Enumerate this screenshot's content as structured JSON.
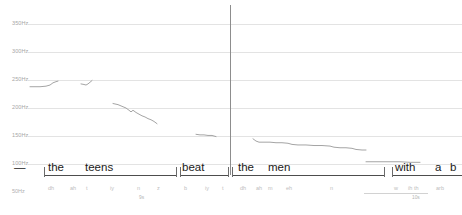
{
  "view": {
    "kind": "pitch-contour-annotation",
    "cursor_x_px": 230,
    "background": "#ffffff",
    "grid_color": "#e3e3e3",
    "contour_color": "#9a9a9a",
    "cursor_color": "#8d8d8d",
    "word_tier_color": "#1a1a1a",
    "phone_tier_color": "#bdbdbd"
  },
  "axis_y": {
    "unit": "Hz",
    "bottom_label": "50Hz",
    "ticks": [
      {
        "label": "350Hz",
        "value": 350,
        "y_px": 24
      },
      {
        "label": "300Hz",
        "value": 300,
        "y_px": 52
      },
      {
        "label": "250Hz",
        "value": 250,
        "y_px": 80
      },
      {
        "label": "200Hz",
        "value": 200,
        "y_px": 108
      },
      {
        "label": "150Hz",
        "value": 150,
        "y_px": 136
      },
      {
        "label": "100Hz",
        "value": 100,
        "y_px": 164
      }
    ]
  },
  "axis_x": {
    "unit": "s",
    "ticks": [
      {
        "label": "9s",
        "value": 9,
        "x_px": 139
      },
      {
        "label": "10s",
        "value": 10,
        "x_px": 412
      }
    ]
  },
  "chart_data": {
    "type": "line",
    "title": "",
    "xlabel": "",
    "ylabel": "Hz",
    "ylim": [
      50,
      350
    ],
    "grid": true,
    "legend": "none",
    "series": [
      {
        "name": "f0-the",
        "points": [
          [
            30,
            238
          ],
          [
            34,
            238
          ],
          [
            40,
            238
          ],
          [
            46,
            239
          ],
          [
            50,
            241
          ],
          [
            53,
            245
          ],
          [
            56,
            247
          ],
          [
            58,
            248
          ]
        ]
      },
      {
        "name": "f0-teens-onset",
        "points": [
          [
            81,
            243
          ],
          [
            84,
            242
          ],
          [
            86,
            241
          ],
          [
            88,
            243
          ],
          [
            90,
            246
          ],
          [
            92,
            249
          ]
        ]
      },
      {
        "name": "f0-teens",
        "points": [
          [
            113,
            208
          ],
          [
            118,
            206
          ],
          [
            122,
            203
          ],
          [
            126,
            200
          ],
          [
            129,
            196
          ],
          [
            131,
            193
          ],
          [
            133,
            196
          ],
          [
            136,
            192
          ],
          [
            139,
            189
          ],
          [
            142,
            186
          ],
          [
            145,
            184
          ],
          [
            148,
            181
          ],
          [
            151,
            179
          ],
          [
            154,
            176
          ],
          [
            157,
            172
          ]
        ]
      },
      {
        "name": "f0-beat",
        "points": [
          [
            196,
            153
          ],
          [
            200,
            152
          ],
          [
            204,
            152
          ],
          [
            208,
            151
          ],
          [
            212,
            151
          ],
          [
            216,
            149
          ]
        ]
      },
      {
        "name": "f0-the-men",
        "points": [
          [
            253,
            145
          ],
          [
            256,
            141
          ],
          [
            259,
            139
          ],
          [
            264,
            139
          ],
          [
            270,
            139
          ],
          [
            276,
            138
          ],
          [
            282,
            138
          ],
          [
            288,
            137
          ],
          [
            292,
            135
          ],
          [
            298,
            134
          ],
          [
            306,
            134
          ],
          [
            314,
            133
          ],
          [
            322,
            133
          ],
          [
            330,
            132
          ],
          [
            334,
            130
          ],
          [
            340,
            129
          ],
          [
            346,
            129
          ],
          [
            352,
            128
          ],
          [
            356,
            126
          ],
          [
            362,
            125
          ],
          [
            366,
            125
          ]
        ]
      },
      {
        "name": "f0-with",
        "points": [
          [
            366,
            104
          ],
          [
            380,
            104
          ],
          [
            392,
            104
          ],
          [
            400,
            104
          ],
          [
            410,
            103
          ],
          [
            420,
            103
          ]
        ]
      }
    ]
  },
  "tiers": {
    "words": [
      {
        "label": "—",
        "x_px": 14,
        "width_px": 12
      },
      {
        "label": "the",
        "x_px": 48,
        "width_px": 22
      },
      {
        "label": "teens",
        "x_px": 85,
        "width_px": 38
      },
      {
        "label": "beat",
        "x_px": 182,
        "width_px": 32
      },
      {
        "label": "the",
        "x_px": 238,
        "width_px": 22
      },
      {
        "label": "men",
        "x_px": 268,
        "width_px": 28
      },
      {
        "label": "with",
        "x_px": 395,
        "width_px": 30
      },
      {
        "label": "a",
        "x_px": 435,
        "width_px": 8
      },
      {
        "label": "b",
        "x_px": 450,
        "width_px": 8
      }
    ],
    "word_rules": [
      {
        "x_px": 44,
        "width_px": 132
      },
      {
        "x_px": 180,
        "width_px": 48
      },
      {
        "x_px": 232,
        "width_px": 152
      },
      {
        "x_px": 392,
        "width_px": 70
      }
    ],
    "word_ticks": [
      44,
      176,
      180,
      228,
      232,
      384,
      392
    ],
    "phonemes": [
      {
        "label": "dh",
        "x_px": 48
      },
      {
        "label": "ah",
        "x_px": 70
      },
      {
        "label": "t",
        "x_px": 86
      },
      {
        "label": "iy",
        "x_px": 110
      },
      {
        "label": "n",
        "x_px": 137
      },
      {
        "label": "z",
        "x_px": 157
      },
      {
        "label": "b",
        "x_px": 184
      },
      {
        "label": "iy",
        "x_px": 205
      },
      {
        "label": "t",
        "x_px": 222
      },
      {
        "label": "dh",
        "x_px": 240
      },
      {
        "label": "ah",
        "x_px": 256
      },
      {
        "label": "m",
        "x_px": 268
      },
      {
        "label": "eh",
        "x_px": 286
      },
      {
        "label": "n",
        "x_px": 330
      },
      {
        "label": "w",
        "x_px": 394
      },
      {
        "label": "ih",
        "x_px": 408
      },
      {
        "label": "th",
        "x_px": 414
      },
      {
        "label": "arb",
        "x_px": 436
      }
    ],
    "phone_rules": [
      {
        "x_px": 364,
        "width_px": 64
      }
    ]
  }
}
